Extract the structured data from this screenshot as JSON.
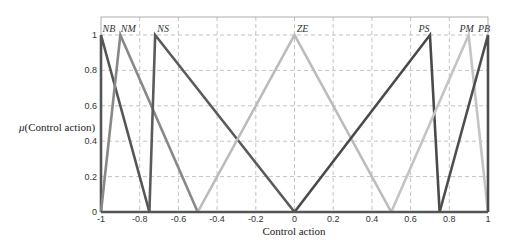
{
  "chart_data": {
    "type": "line",
    "title": "",
    "xlabel": "Control action",
    "ylabel": "μ(Control action)",
    "xlim": [
      -1,
      1
    ],
    "ylim": [
      0,
      1
    ],
    "grid": true,
    "legend": "none (labels placed at peaks)",
    "x_ticks": [
      "-1",
      "-0.8",
      "-0.6",
      "-0.4",
      "-0.2",
      "0",
      "0.2",
      "0.4",
      "0.6",
      "0.8",
      "1"
    ],
    "y_ticks": [
      "0",
      "0.2",
      "0.4",
      "0.6",
      "0.8",
      "1"
    ],
    "series": [
      {
        "name": "NB",
        "color": "#555555",
        "x": [
          -1,
          -1,
          -0.75
        ],
        "y": [
          0,
          1,
          0
        ]
      },
      {
        "name": "NM",
        "color": "#888888",
        "x": [
          -1,
          -0.9,
          -0.5
        ],
        "y": [
          0,
          1,
          0
        ]
      },
      {
        "name": "NS",
        "color": "#5a5a5a",
        "x": [
          -0.75,
          -0.72,
          0
        ],
        "y": [
          0,
          1,
          0
        ]
      },
      {
        "name": "ZE",
        "color": "#bbbbbb",
        "x": [
          -0.5,
          0,
          0.5
        ],
        "y": [
          0,
          1,
          0
        ]
      },
      {
        "name": "PS",
        "color": "#4a4a4a",
        "x": [
          0,
          0.7,
          0.75
        ],
        "y": [
          0,
          1,
          0
        ]
      },
      {
        "name": "PM",
        "color": "#c4c4c4",
        "x": [
          0.5,
          0.9,
          1
        ],
        "y": [
          0,
          1,
          0
        ]
      },
      {
        "name": "PB",
        "color": "#4e4e4e",
        "x": [
          0.75,
          1,
          1
        ],
        "y": [
          0,
          1,
          0
        ]
      }
    ]
  },
  "labels": {
    "xlabel": "Control action",
    "ylabel_mu": "μ",
    "ylabel_rest": "(Control action)"
  }
}
